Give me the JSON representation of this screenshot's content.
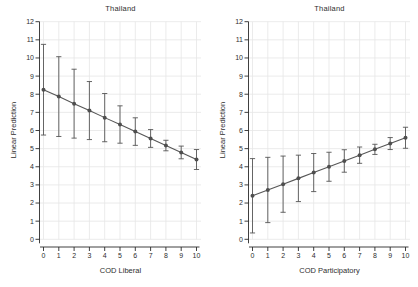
{
  "figure": {
    "background": "#ffffff",
    "accent": "#565656",
    "marker_color": "#4e4e4e",
    "grid_color": "#e6e6e6",
    "axis_color": "#2a2a2a",
    "text_color": "#2e2e2e"
  },
  "chart_data": [
    {
      "type": "line",
      "title": "Thailand",
      "xlabel": "COD Liberal",
      "ylabel": "Linear Prediction",
      "xlim": [
        0,
        10
      ],
      "ylim": [
        0,
        12
      ],
      "xticks": [
        0,
        1,
        2,
        3,
        4,
        5,
        6,
        7,
        8,
        9,
        10
      ],
      "yticks": [
        0,
        1,
        2,
        3,
        4,
        5,
        6,
        7,
        8,
        9,
        10,
        11,
        12
      ],
      "grid": true,
      "legend": "none",
      "marker": "circle",
      "error_bars": true,
      "x": [
        0,
        1,
        2,
        3,
        4,
        5,
        6,
        7,
        8,
        9,
        10
      ],
      "fit": [
        8.25,
        7.87,
        7.48,
        7.1,
        6.71,
        6.33,
        5.94,
        5.56,
        5.17,
        4.79,
        4.4
      ],
      "ci_low": [
        5.75,
        5.67,
        5.58,
        5.5,
        5.38,
        5.3,
        5.18,
        5.07,
        4.88,
        4.44,
        3.85
      ],
      "ci_high": [
        10.75,
        10.07,
        9.38,
        8.7,
        8.04,
        7.36,
        6.7,
        6.05,
        5.46,
        5.14,
        4.95
      ]
    },
    {
      "type": "line",
      "title": "Thailand",
      "xlabel": "COD Participatory",
      "ylabel": "Linear Prediction",
      "xlim": [
        0,
        10
      ],
      "ylim": [
        0,
        12
      ],
      "xticks": [
        0,
        1,
        2,
        3,
        4,
        5,
        6,
        7,
        8,
        9,
        10
      ],
      "yticks": [
        0,
        1,
        2,
        3,
        4,
        5,
        6,
        7,
        8,
        9,
        10,
        11,
        12
      ],
      "grid": true,
      "legend": "none",
      "marker": "circle",
      "error_bars": true,
      "x": [
        0,
        1,
        2,
        3,
        4,
        5,
        6,
        7,
        8,
        9,
        10
      ],
      "fit": [
        2.4,
        2.72,
        3.04,
        3.36,
        3.68,
        4.0,
        4.32,
        4.64,
        4.96,
        5.28,
        5.6
      ],
      "ci_low": [
        0.35,
        0.92,
        1.49,
        2.08,
        2.63,
        3.2,
        3.7,
        4.19,
        4.68,
        4.95,
        5.02
      ],
      "ci_high": [
        4.45,
        4.52,
        4.59,
        4.64,
        4.73,
        4.8,
        4.94,
        5.09,
        5.24,
        5.61,
        6.18
      ]
    }
  ]
}
